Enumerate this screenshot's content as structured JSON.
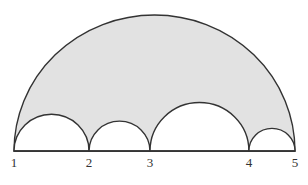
{
  "diagram": {
    "fill_color": "#e2e2e2",
    "stroke_color": "#333333",
    "points": [
      {
        "label": "1",
        "position": 0.0
      },
      {
        "label": "2",
        "position": 0.267
      },
      {
        "label": "3",
        "position": 0.484
      },
      {
        "label": "4",
        "position": 0.836
      },
      {
        "label": "5",
        "position": 1.0
      }
    ]
  }
}
